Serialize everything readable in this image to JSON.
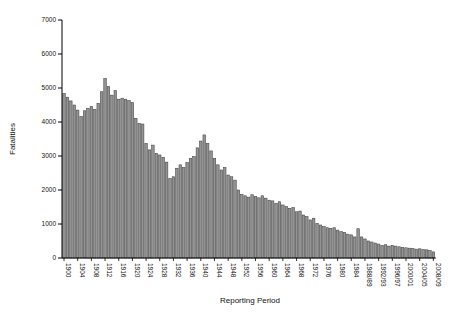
{
  "figure": {
    "background": "#ffffff",
    "width": 457,
    "height": 314
  },
  "chart_data": {
    "type": "bar",
    "title": "",
    "xlabel": "Reporting Period",
    "ylabel": "Fatalities",
    "ylim": [
      0,
      7000
    ],
    "yticks": [
      0,
      1000,
      2000,
      3000,
      4000,
      5000,
      6000,
      7000
    ],
    "grid": false,
    "legend": null,
    "label_every": 4,
    "bar_color": "#949494",
    "bar_edge_color": "#3f3f3f",
    "axis_color": "#000000",
    "tick_text_color": "#111111",
    "categories": [
      "1900",
      "1901",
      "1902",
      "1903",
      "1904",
      "1905",
      "1906",
      "1907",
      "1908",
      "1909",
      "1910",
      "1911",
      "1912",
      "1913",
      "1914",
      "1915",
      "1916",
      "1917",
      "1918",
      "1919",
      "1920",
      "1921",
      "1922",
      "1923",
      "1924",
      "1925",
      "1926",
      "1927",
      "1928",
      "1929",
      "1930",
      "1931",
      "1932",
      "1933",
      "1934",
      "1935",
      "1936",
      "1937",
      "1938",
      "1939",
      "1940",
      "1941",
      "1942",
      "1943",
      "1944",
      "1945",
      "1946",
      "1947",
      "1948",
      "1949",
      "1950",
      "1951",
      "1952",
      "1953",
      "1954",
      "1955",
      "1956",
      "1957",
      "1958",
      "1959",
      "1960",
      "1961",
      "1962",
      "1963",
      "1964",
      "1965",
      "1966",
      "1967",
      "1968",
      "1969",
      "1970",
      "1971",
      "1972",
      "1973",
      "1974",
      "1975",
      "1976",
      "1977",
      "1978",
      "1979",
      "1980",
      "1981",
      "1982",
      "1983",
      "1984",
      "1985",
      "1986/87",
      "1987/88",
      "1988/89",
      "1989/90",
      "1990/91",
      "1991/92",
      "1992/93",
      "1993/94",
      "1994/95",
      "1995/96",
      "1996/97",
      "1997/98",
      "1998/99",
      "1999/00",
      "2000/01",
      "2001/02",
      "2002/03",
      "2003/04",
      "2004/05",
      "2005/06",
      "2006/07",
      "2007/08",
      "2008/09"
    ],
    "values": [
      4840,
      4730,
      4620,
      4500,
      4350,
      4160,
      4330,
      4400,
      4450,
      4370,
      4550,
      4890,
      5280,
      5040,
      4790,
      4920,
      4670,
      4700,
      4670,
      4630,
      4570,
      4110,
      3960,
      3940,
      3370,
      3180,
      3320,
      3080,
      3030,
      2960,
      2820,
      2340,
      2390,
      2640,
      2740,
      2660,
      2810,
      2930,
      2980,
      3240,
      3440,
      3620,
      3370,
      3150,
      2930,
      2740,
      2590,
      2660,
      2440,
      2390,
      2290,
      2000,
      1870,
      1830,
      1790,
      1860,
      1810,
      1770,
      1830,
      1760,
      1700,
      1680,
      1610,
      1655,
      1560,
      1510,
      1460,
      1480,
      1360,
      1380,
      1265,
      1215,
      1120,
      1170,
      1020,
      970,
      920,
      890,
      870,
      890,
      820,
      775,
      755,
      700,
      680,
      620,
      860,
      620,
      560,
      500,
      470,
      440,
      410,
      370,
      390,
      350,
      370,
      350,
      330,
      310,
      300,
      290,
      280,
      260,
      270,
      250,
      240,
      220,
      180
    ]
  }
}
